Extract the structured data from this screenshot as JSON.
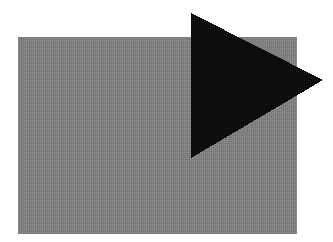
{
  "canvas": {
    "width": 333,
    "height": 242,
    "background_color": "#ffffff",
    "description": "Abstract shape composition: a gray rectangle overlapped by a black right-pointing triangle"
  },
  "shapes": [
    {
      "name": "gray-rectangle",
      "type": "rectangle",
      "fill_color": "#808080",
      "texture": "dithered-halftone",
      "x": 18,
      "y": 37,
      "width": 279,
      "height": 197
    },
    {
      "name": "black-triangle",
      "type": "triangle",
      "orientation": "right-pointing",
      "fill_color": "#0d0d0d",
      "texture": "noisy-solid",
      "points": "191,13 191,158 323,80",
      "vertices": [
        {
          "label": "top-left",
          "x": 191,
          "y": 13
        },
        {
          "label": "bottom-left",
          "x": 191,
          "y": 158
        },
        {
          "label": "right-apex",
          "x": 323,
          "y": 80
        }
      ]
    }
  ],
  "palette": {
    "background": "#ffffff",
    "gray": "#808080",
    "black": "#0d0d0d"
  }
}
